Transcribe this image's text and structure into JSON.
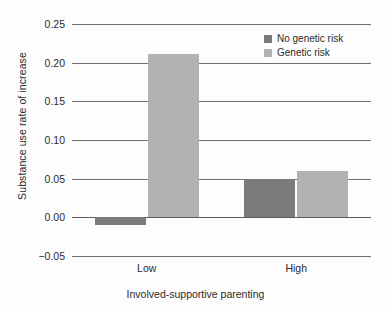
{
  "chart_data": {
    "type": "bar",
    "title": "",
    "xlabel": "Involved-supportive parenting",
    "ylabel": "Substance use rate of increase",
    "categories": [
      "Low",
      "High"
    ],
    "series": [
      {
        "name": "No genetic risk",
        "color": "#7b7b7b",
        "values": [
          -0.01,
          0.05
        ]
      },
      {
        "name": "Genetic risk",
        "color": "#b2b2b2",
        "values": [
          0.211,
          0.06
        ]
      }
    ],
    "ylim": [
      -0.05,
      0.25
    ],
    "yticks": [
      "0.25",
      "0.20",
      "0.15",
      "0.10",
      "0.05",
      "0.00",
      "−0.05"
    ],
    "ytick_values": [
      0.25,
      0.2,
      0.15,
      0.1,
      0.05,
      0.0,
      -0.05
    ],
    "grid": true,
    "legend_position": "top-right"
  },
  "legend": {
    "items": [
      {
        "label": "No genetic risk"
      },
      {
        "label": "Genetic risk"
      }
    ]
  }
}
